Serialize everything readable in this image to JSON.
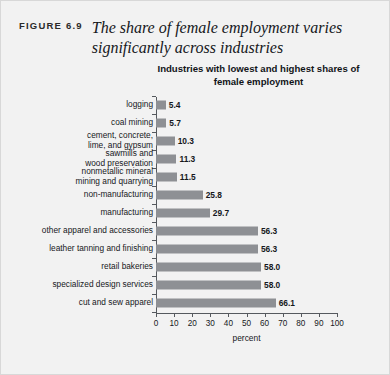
{
  "figure": {
    "number": "FIGURE 6.9",
    "title": "The share of female employment varies significantly across industries"
  },
  "chart_data": {
    "type": "bar",
    "orientation": "horizontal",
    "title": "Industries with lowest and highest shares of female employment",
    "xlabel": "percent",
    "ylabel": "",
    "xlim": [
      0,
      100
    ],
    "grid": false,
    "legend": null,
    "bar_color": "#8e9094",
    "xticks": [
      0,
      10,
      20,
      30,
      40,
      50,
      60,
      70,
      80,
      90,
      100
    ],
    "xtick_labels": [
      "0",
      "10",
      "20",
      "30",
      "40",
      "50",
      "60",
      "70",
      "80",
      "90",
      "100"
    ],
    "categories": [
      "logging",
      "coal mining",
      "cement, concrete,\nlime, and gypsum",
      "sawmills and\nwood preservation",
      "nonmetallic mineral\nmining and quarrying",
      "non-manufacturing",
      "manufacturing",
      "other apparel and accessories",
      "leather tanning and finishing",
      "retail bakeries",
      "specialized design services",
      "cut and sew apparel"
    ],
    "values": [
      5.4,
      5.7,
      10.3,
      11.3,
      11.5,
      25.8,
      29.7,
      56.3,
      56.3,
      58.0,
      58.0,
      66.1
    ],
    "value_labels": [
      "5.4",
      "5.7",
      "10.3",
      "11.3",
      "11.5",
      "25.8",
      "29.7",
      "56.3",
      "56.3",
      "58.0",
      "58.0",
      "66.1"
    ]
  }
}
